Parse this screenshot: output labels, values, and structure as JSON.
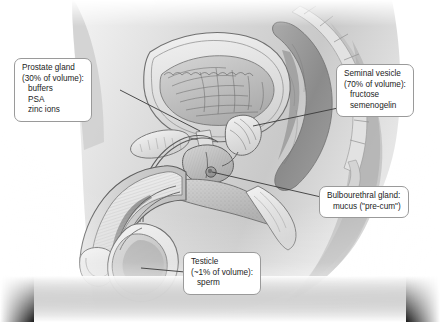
{
  "figure": {
    "style": "grayscale medical illustration",
    "background_color": "#ffffff",
    "ink_color": "#1c1c1c",
    "callout_border_color": "#9a9a9a",
    "callout_fill_color": "#ffffff",
    "leader_color": "#3a3a3a"
  },
  "callouts": [
    {
      "id": "prostate",
      "name": "prostate-gland-callout",
      "lines": [
        "Prostate gland",
        "(30% of volume):",
        "buffers",
        "PSA",
        "zinc ions"
      ],
      "indented": [
        false,
        false,
        true,
        true,
        true
      ],
      "leader": {
        "from": [
          14,
          90
        ],
        "to": [
          200,
          131
        ]
      }
    },
    {
      "id": "seminal",
      "name": "seminal-vesicle-callout",
      "lines": [
        "Seminal vesicle",
        "(70% of volume):",
        "fructose",
        "semenogelin"
      ],
      "indented": [
        false,
        false,
        true,
        true
      ],
      "leader": {
        "from": [
          336,
          108
        ],
        "to": [
          253,
          126
        ]
      }
    },
    {
      "id": "bulbourethral",
      "name": "bulbourethral-gland-callout",
      "lines": [
        "Bulbourethral gland:",
        "mucus (\"pre-cum\")"
      ],
      "indented": [
        false,
        true
      ],
      "leader": {
        "from": [
          319,
          197
        ],
        "to": [
          212,
          172
        ]
      }
    },
    {
      "id": "testicle",
      "name": "testicle-callout",
      "lines": [
        "Testicle",
        "(~1% of volume):",
        "sperm"
      ],
      "indented": [
        false,
        false,
        true
      ],
      "leader": {
        "from": [
          183,
          272
        ],
        "to": [
          141,
          268
        ]
      }
    }
  ],
  "anatomy_labels": [
    "bladder",
    "prostate gland",
    "seminal vesicle",
    "bulbourethral gland",
    "testicle",
    "rectum",
    "penis",
    "scrotum",
    "sacrum",
    "pubic bone"
  ]
}
